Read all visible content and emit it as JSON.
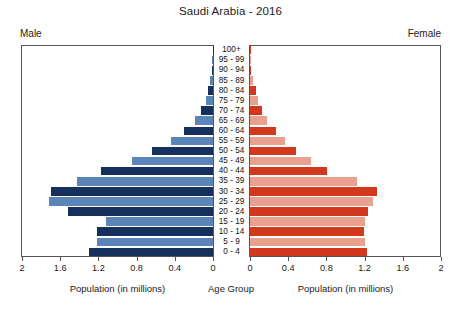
{
  "chart_data": {
    "type": "bar",
    "subtype": "population-pyramid",
    "title": "Saudi Arabia - 2016",
    "xlabel": "Population (in millions)",
    "center_axis_label": "Age Group",
    "grid": false,
    "legend_position": "none",
    "xlim": [
      0,
      2
    ],
    "xticks": [
      2,
      1.6,
      1.2,
      0.8,
      0.4,
      0
    ],
    "xticklabels_left": [
      "2",
      "1.6",
      "1.2",
      "0.8",
      "0.4",
      "0"
    ],
    "xticklabels_right": [
      "0",
      "0.4",
      "0.8",
      "1.2",
      "1.6",
      "2"
    ],
    "categories": [
      "100+",
      "95 - 99",
      "90 - 94",
      "85 - 89",
      "80 - 84",
      "75 - 79",
      "70 - 74",
      "65 - 69",
      "60 - 64",
      "55 - 59",
      "50 - 54",
      "45 - 49",
      "40 - 44",
      "35 - 39",
      "30 - 34",
      "25 - 29",
      "20 - 24",
      "15 - 19",
      "10 - 14",
      "5 - 9",
      "0 - 4"
    ],
    "series": [
      {
        "name": "Male",
        "side": "left",
        "units": "millions",
        "values": [
          0.002,
          0.006,
          0.015,
          0.03,
          0.055,
          0.075,
          0.125,
          0.185,
          0.3,
          0.44,
          0.64,
          0.85,
          1.17,
          1.42,
          1.7,
          1.72,
          1.52,
          1.12,
          1.22,
          1.22,
          1.3
        ]
      },
      {
        "name": "Female",
        "side": "right",
        "units": "millions",
        "values": [
          0.002,
          0.006,
          0.015,
          0.03,
          0.06,
          0.08,
          0.13,
          0.18,
          0.27,
          0.37,
          0.48,
          0.64,
          0.81,
          1.12,
          1.33,
          1.29,
          1.24,
          1.2,
          1.19,
          1.2,
          1.23
        ]
      }
    ],
    "colors": {
      "male_dark": "#15305c",
      "male_light": "#5b85b8",
      "female_dark": "#d1381c",
      "female_light": "#e9a08c",
      "axis": "#555555",
      "text": "#1a1a1a"
    }
  },
  "labels": {
    "male_side": "Male",
    "female_side": "Female"
  }
}
